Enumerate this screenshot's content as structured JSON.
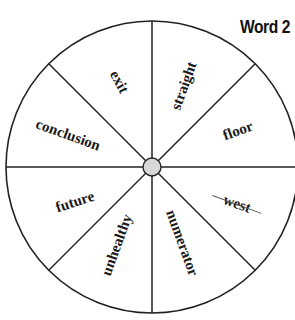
{
  "title": "Word 2",
  "wheel": {
    "center": [
      152,
      167
    ],
    "radius": 146,
    "hub_radius": 9,
    "hub_color": "#d8d8d8",
    "line_color": "#222222",
    "spoke_angles_deg": [
      0,
      45,
      90,
      135,
      180,
      225,
      270,
      315
    ]
  },
  "segments": [
    {
      "label": "exit",
      "x": 119,
      "y": 82,
      "rotate": 62,
      "crossed_out": false
    },
    {
      "label": "straight",
      "x": 184,
      "y": 86,
      "rotate": -70,
      "crossed_out": false
    },
    {
      "label": "floor",
      "x": 238,
      "y": 131,
      "rotate": -20,
      "crossed_out": false
    },
    {
      "label": "west",
      "x": 237,
      "y": 204,
      "rotate": 20,
      "crossed_out": true
    },
    {
      "label": "numerator",
      "x": 182,
      "y": 243,
      "rotate": 70,
      "crossed_out": false
    },
    {
      "label": "unhealthy",
      "x": 117,
      "y": 245,
      "rotate": -70,
      "crossed_out": false
    },
    {
      "label": "future",
      "x": 75,
      "y": 202,
      "rotate": -18,
      "crossed_out": false
    },
    {
      "label": "conclusion",
      "x": 68,
      "y": 135,
      "rotate": 20,
      "crossed_out": false
    }
  ]
}
